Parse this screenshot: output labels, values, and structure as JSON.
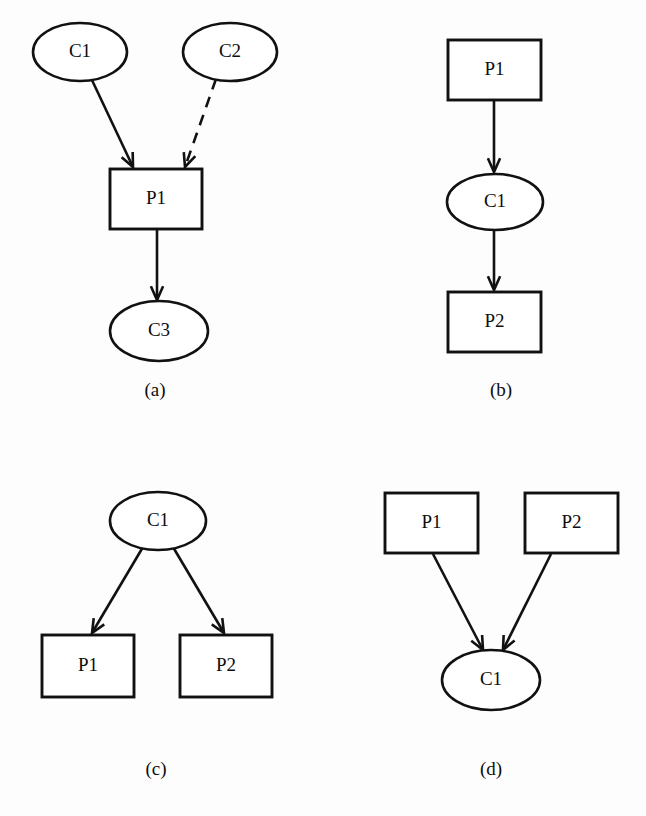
{
  "figure": {
    "background_color": "#fdfdfd",
    "stroke_color": "#111111",
    "text_color": "#0d0d0d",
    "panels": [
      {
        "id": "panel-a",
        "caption": "(a)",
        "caption_x": 155,
        "caption_y": 392,
        "nodes": [
          {
            "id": "a-c1",
            "label": "C1",
            "shape": "ellipse",
            "cx": 80,
            "cy": 52,
            "rx": 47,
            "ry": 29
          },
          {
            "id": "a-c2",
            "label": "C2",
            "shape": "ellipse",
            "cx": 230,
            "cy": 52,
            "rx": 47,
            "ry": 29
          },
          {
            "id": "a-p1",
            "label": "P1",
            "shape": "rect",
            "x": 110,
            "y": 169,
            "w": 92,
            "h": 60
          },
          {
            "id": "a-c3",
            "label": "C3",
            "shape": "ellipse",
            "cx": 159,
            "cy": 331,
            "rx": 49,
            "ry": 30
          }
        ],
        "edges": [
          {
            "id": "a-edge-c1-p1",
            "from": "a-c1",
            "to": "a-p1",
            "style": "solid",
            "x1": 91,
            "y1": 78,
            "x2": 133,
            "y2": 167
          },
          {
            "id": "a-edge-c2-p1",
            "from": "a-c2",
            "to": "a-p1",
            "style": "dashed",
            "x1": 216,
            "y1": 79,
            "x2": 185,
            "y2": 167
          },
          {
            "id": "a-edge-p1-c3",
            "from": "a-p1",
            "to": "a-c3",
            "style": "solid",
            "x1": 157,
            "y1": 230,
            "x2": 157,
            "y2": 300
          }
        ]
      },
      {
        "id": "panel-b",
        "caption": "(b)",
        "caption_x": 501,
        "caption_y": 392,
        "nodes": [
          {
            "id": "b-p1",
            "label": "P1",
            "shape": "rect",
            "x": 448,
            "y": 40,
            "w": 93,
            "h": 60
          },
          {
            "id": "b-c1",
            "label": "C1",
            "shape": "ellipse",
            "cx": 495,
            "cy": 202,
            "rx": 48,
            "ry": 28
          },
          {
            "id": "b-p2",
            "label": "P2",
            "shape": "rect",
            "x": 448,
            "y": 292,
            "w": 93,
            "h": 60
          }
        ],
        "edges": [
          {
            "id": "b-edge-p1-c1",
            "from": "b-p1",
            "to": "b-c1",
            "style": "solid",
            "x1": 494,
            "y1": 101,
            "x2": 494,
            "y2": 172
          },
          {
            "id": "b-edge-c1-p2",
            "from": "b-c1",
            "to": "b-p2",
            "style": "solid",
            "x1": 494,
            "y1": 231,
            "x2": 494,
            "y2": 290
          }
        ]
      },
      {
        "id": "panel-c",
        "caption": "(c)",
        "caption_x": 156,
        "caption_y": 771,
        "nodes": [
          {
            "id": "c-c1",
            "label": "C1",
            "shape": "ellipse",
            "cx": 158,
            "cy": 521,
            "rx": 48,
            "ry": 29
          },
          {
            "id": "c-p1",
            "label": "P1",
            "shape": "rect",
            "x": 42,
            "y": 635,
            "w": 92,
            "h": 62
          },
          {
            "id": "c-p2",
            "label": "P2",
            "shape": "rect",
            "x": 180,
            "y": 635,
            "w": 92,
            "h": 62
          }
        ],
        "edges": [
          {
            "id": "c-edge-c1-p1",
            "from": "c-c1",
            "to": "c-p1",
            "style": "solid",
            "x1": 143,
            "y1": 547,
            "x2": 92,
            "y2": 633
          },
          {
            "id": "c-edge-c1-p2",
            "from": "c-c1",
            "to": "c-p2",
            "style": "solid",
            "x1": 173,
            "y1": 547,
            "x2": 224,
            "y2": 633
          }
        ]
      },
      {
        "id": "panel-d",
        "caption": "(d)",
        "caption_x": 491,
        "caption_y": 771,
        "nodes": [
          {
            "id": "d-p1",
            "label": "P1",
            "shape": "rect",
            "x": 385,
            "y": 493,
            "w": 93,
            "h": 60
          },
          {
            "id": "d-p2",
            "label": "P2",
            "shape": "rect",
            "x": 525,
            "y": 493,
            "w": 93,
            "h": 60
          },
          {
            "id": "d-c1",
            "label": "C1",
            "shape": "ellipse",
            "cx": 491,
            "cy": 680,
            "rx": 49,
            "ry": 30
          }
        ],
        "edges": [
          {
            "id": "d-edge-p1-c1",
            "from": "d-p1",
            "to": "d-c1",
            "style": "solid",
            "x1": 433,
            "y1": 554,
            "x2": 483,
            "y2": 650
          },
          {
            "id": "d-edge-p2-c1",
            "from": "d-p2",
            "to": "d-c1",
            "style": "solid",
            "x1": 551,
            "y1": 554,
            "x2": 503,
            "y2": 650
          }
        ]
      }
    ],
    "node_labels": [
      "C1",
      "C2",
      "C3",
      "P1",
      "P2"
    ],
    "captions": [
      "(a)",
      "(b)",
      "(c)",
      "(d)"
    ]
  }
}
